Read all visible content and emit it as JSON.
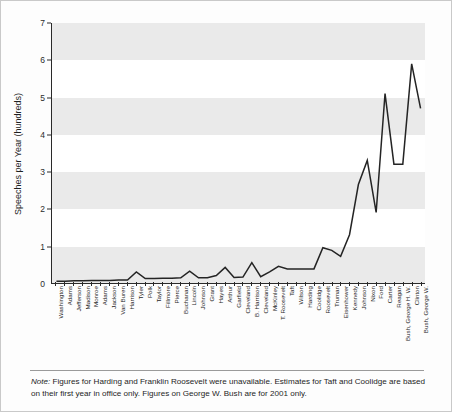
{
  "chart_data": {
    "type": "line",
    "title": "",
    "xlabel": "",
    "ylabel": "Speeches per Year (hundreds)",
    "ylim": [
      0,
      7
    ],
    "yticks": [
      0,
      1,
      2,
      3,
      4,
      5,
      6,
      7
    ],
    "grid": "alternating horizontal bands",
    "legend": "none",
    "categories": [
      "Washington",
      "Adams",
      "Jefferson",
      "Madison",
      "Monroe",
      "Adams",
      "Jackson",
      "Van Buren",
      "Harrison",
      "Tyler",
      "Polk",
      "Taylor",
      "Fillmore",
      "Pierce",
      "Buchanan",
      "Lincoln",
      "Johnson",
      "Grant",
      "Hayes",
      "Arthur",
      "Garfield",
      "Cleveland",
      "B. Harrison",
      "Cleveland",
      "McKinley",
      "T. Roosevelt",
      "Taft",
      "Wilson",
      "Harding",
      "Coolidge",
      "Roosevelt",
      "Truman",
      "Eisenhower",
      "Kennedy",
      "Johnson",
      "Nixon",
      "Ford",
      "Carter",
      "Reagan",
      "Bush, George H. W.",
      "Clinton",
      "Bush, George W."
    ],
    "values": [
      0.05,
      0.05,
      0.06,
      0.06,
      0.07,
      0.07,
      0.07,
      0.08,
      0.08,
      0.3,
      0.12,
      0.12,
      0.13,
      0.13,
      0.14,
      0.32,
      0.14,
      0.14,
      0.2,
      0.42,
      0.15,
      0.16,
      0.55,
      0.17,
      0.3,
      0.45,
      0.38,
      0.38,
      0.38,
      0.38,
      0.95,
      0.88,
      0.72,
      1.3,
      2.65,
      3.3,
      1.9,
      5.1,
      3.2,
      3.2,
      5.9,
      4.7
    ],
    "annotations": {
      "note_lead": "Note:",
      "note_text": " Figures for Harding and Franklin Roosevelt were unavailable. Estimates for Taft and Coolidge are based on their first year in office only. Figures on George W. Bush are for 2001 only."
    },
    "colors": {
      "line": "#242424",
      "band": "#eaeaea",
      "axis": "#2a2a2a",
      "plot_background": "#ffffff",
      "figure_background": "#fdfdfd",
      "border": "#c9c9c9"
    }
  }
}
